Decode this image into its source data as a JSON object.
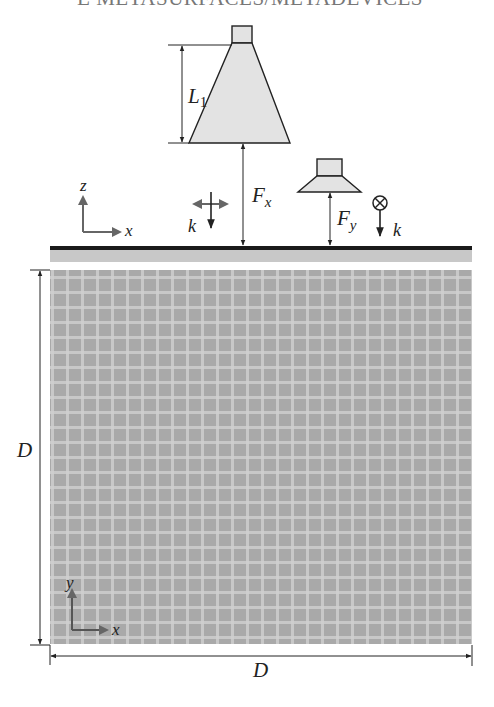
{
  "header": {
    "running_title": "E METASURFACES/METADEVICES"
  },
  "diagram": {
    "labels": {
      "horn_length": "L",
      "horn_length_sub": "1",
      "focal_x": "F",
      "focal_x_sub": "x",
      "focal_y": "F",
      "focal_y_sub": "y",
      "wave_vector_left": "k",
      "wave_vector_right": "k",
      "side_axis_z": "z",
      "side_axis_x": "x",
      "top_axis_y": "y",
      "top_axis_x": "x",
      "dimension_left": "D",
      "dimension_bottom": "D"
    },
    "colors": {
      "horn_fill": "#e3e3e3",
      "line": "#222222",
      "arrow_gray": "#666666",
      "substrate": "#c8c8c8",
      "metasurface_bg": "#a9a9a9",
      "grid_line": "#d2d2d2"
    }
  }
}
